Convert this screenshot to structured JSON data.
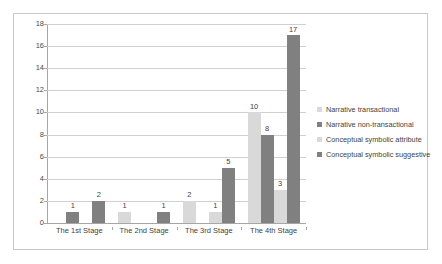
{
  "chart_data": {
    "type": "bar",
    "title": "",
    "xlabel": "",
    "ylabel": "",
    "ylim": [
      0,
      18
    ],
    "ytick_step": 2,
    "yticks": [
      0,
      2,
      4,
      6,
      8,
      10,
      12,
      14,
      16,
      18
    ],
    "grid": "horizontal",
    "legend_position": "right",
    "categories": [
      "The 1st Stage",
      "The 2nd Stage",
      "The 3rd Stage",
      "The 4th Stage"
    ],
    "series": [
      {
        "name": "Narrative transactional",
        "color": "#d9d9d9",
        "values": [
          null,
          1,
          2,
          10
        ]
      },
      {
        "name": "Narrative non-transactional",
        "color": "#808080",
        "values": [
          1,
          null,
          null,
          8
        ]
      },
      {
        "name": "Conceptual symbolic attribute",
        "color": "#d9d9d9",
        "values": [
          null,
          null,
          1,
          3
        ]
      },
      {
        "name": "Conceptual symbolic suggestive",
        "color": "#808080",
        "values": [
          2,
          1,
          5,
          17
        ]
      }
    ]
  },
  "legend": {
    "items": [
      {
        "label": "Narrative transactional",
        "color": "#d9d9d9"
      },
      {
        "label": "Narrative non-transactional",
        "color": "#808080"
      },
      {
        "label": "Conceptual symbolic attribute",
        "color": "#d9d9d9"
      },
      {
        "label": "Conceptual symbolic suggestive",
        "color": "#808080"
      }
    ]
  },
  "colors": {
    "gridline": "#d0d0d0",
    "axis": "#a6a6a6",
    "border": "#c8c8c8",
    "background": "#ffffff",
    "text": "#3f3f3f"
  }
}
